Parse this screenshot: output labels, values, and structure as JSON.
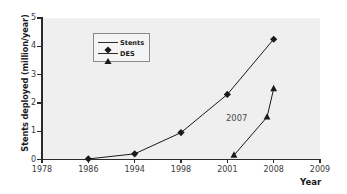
{
  "chart_data": {
    "type": "line",
    "title": "",
    "xlabel": "Year",
    "ylabel": "Stents deployed (million/year)",
    "xticklabels": [
      "1978",
      "1986",
      "1994",
      "1998",
      "2001",
      "2008",
      "2009"
    ],
    "yticklabels": [
      "0",
      "1",
      "2",
      "3",
      "4",
      "5"
    ],
    "ylim": [
      0,
      5
    ],
    "grid": false,
    "legend_position": "upper-left-inner",
    "annotations": [
      {
        "text": "2007",
        "x": 2007,
        "y": 1.55
      }
    ],
    "series": [
      {
        "name": "Stents",
        "marker": "diamond",
        "color": "#1a1a1a",
        "points": [
          {
            "x": "1986",
            "y": 0.02
          },
          {
            "x": "1994",
            "y": 0.2
          },
          {
            "x": "1998",
            "y": 0.95
          },
          {
            "x": "2001",
            "y": 2.3
          },
          {
            "x": "2008",
            "y": 4.25
          }
        ]
      },
      {
        "name": "DES",
        "marker": "triangle",
        "color": "#1a1a1a",
        "points": [
          {
            "x": "2002",
            "y": 0.15
          },
          {
            "x": "2007",
            "y": 1.5
          },
          {
            "x": "2008",
            "y": 2.5
          }
        ]
      }
    ]
  },
  "legend": {
    "entries": [
      {
        "label": "Stents",
        "marker": "diamond-marker-icon"
      },
      {
        "label": "DES",
        "marker": "triangle-marker-icon"
      }
    ]
  },
  "axes": {
    "y_title": "Stents deployed (million/year)",
    "x_title": "Year"
  },
  "colors": {
    "plot_background": "#efefef",
    "figure_background": "#ffffff",
    "axis": "#2b2b2b",
    "series": "#1a1a1a",
    "tick_label": "#3a3a3a",
    "annotation": "#4a4a4a"
  }
}
